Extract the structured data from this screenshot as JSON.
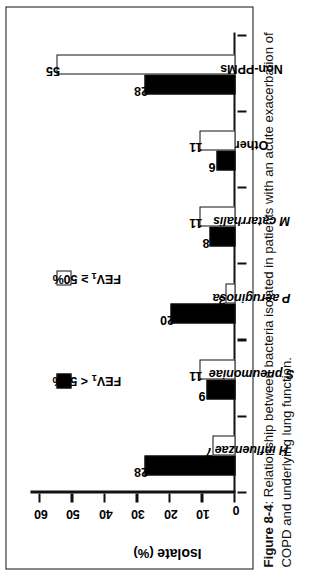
{
  "figure": {
    "caption_number": "Figure 8-4",
    "caption_separator": ": ",
    "caption_text": "Relationship between bacteria isolated in patients with an acute exacerbation of COPD and underlying lung function."
  },
  "legend": {
    "position": "top-center",
    "items": [
      {
        "label": "FEV",
        "sub": "1",
        "suffix": " < 50%",
        "swatch": "filled-square-swatch",
        "color": "#000000"
      },
      {
        "label": "FEV",
        "sub": "1",
        "suffix": " ≥ 50%",
        "swatch": "open-square-swatch",
        "color": "#ffffff"
      }
    ]
  },
  "axes": {
    "y_title_main": "Isolate",
    "y_title_units": " (%)",
    "y_ticks": [
      "0",
      "10",
      "20",
      "30",
      "40",
      "50",
      "60"
    ],
    "y_min": 0,
    "y_max": 60
  },
  "chart_data": {
    "type": "bar",
    "title": "",
    "subtitle": "",
    "xlabel": "",
    "ylabel": "Isolate (%)",
    "ylim": [
      0,
      60
    ],
    "yticks": [
      0,
      10,
      20,
      30,
      40,
      50,
      60
    ],
    "grid": false,
    "legend_position": "top-center",
    "orientation": "vertical",
    "categories": [
      "H influenzae",
      "S pneumoniae",
      "P aeruginosa",
      "M catarrhalis",
      "Other",
      "Non-PPMs"
    ],
    "categories_italic": [
      true,
      true,
      true,
      true,
      false,
      false
    ],
    "series": [
      {
        "name": "FEV1 < 50%",
        "fill": "#000000",
        "values": [
          28,
          9,
          20,
          8,
          6,
          28
        ],
        "labels": [
          "28",
          "9",
          "20",
          "8",
          "6",
          "28"
        ]
      },
      {
        "name": "FEV1 ≥ 50%",
        "fill": "#ffffff",
        "values": [
          7,
          11,
          3,
          11,
          11,
          55
        ],
        "labels": [
          "7",
          "11",
          "3",
          "11",
          "11",
          "55"
        ]
      }
    ]
  }
}
